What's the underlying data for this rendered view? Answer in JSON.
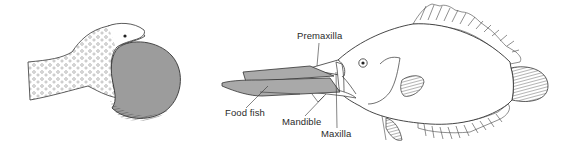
{
  "figure": {
    "left_panel": {
      "subject": "snake-swallowing-egg"
    },
    "right_panel": {
      "subject": "fish-with-protrusible-jaw-catching-food-fish",
      "labels": {
        "premaxilla": "Premaxilla",
        "food_fish": "Food fish",
        "mandible": "Mandible",
        "maxilla": "Maxilla"
      }
    },
    "colors": {
      "ink": "#2a2a2a",
      "fill_grey": "#a9a9a9",
      "egg_grey": "#9c9c9c",
      "background": "#ffffff"
    }
  }
}
